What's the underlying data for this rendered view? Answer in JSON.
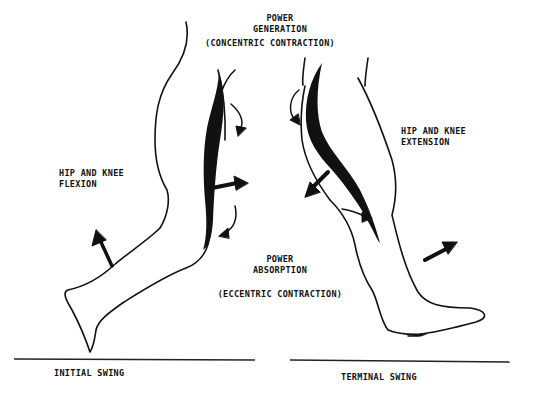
{
  "diagram": {
    "top_label": {
      "line1": "POWER",
      "line2": "GENERATION",
      "line3": "(CONCENTRIC CONTRACTION)"
    },
    "left_label": {
      "line1": "HIP AND KNEE",
      "line2": "FLEXION"
    },
    "right_label": {
      "line1": "HIP AND KNEE",
      "line2": "EXTENSION"
    },
    "middle_label": {
      "line1": "POWER",
      "line2": "ABSORPTION",
      "line3": "(ECCENTRIC CONTRACTION)"
    },
    "left_phase": "INITIAL SWING",
    "right_phase": "TERMINAL SWING",
    "colors": {
      "ink": "#111111",
      "background": "#ffffff"
    }
  }
}
